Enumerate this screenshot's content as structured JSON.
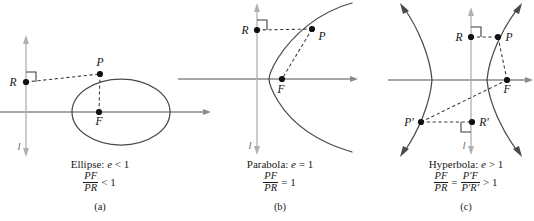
{
  "figure": {
    "panels": [
      {
        "id": "a",
        "curve_type": "ellipse",
        "caption_title_prefix": "Ellipse:",
        "caption_title_var": "e",
        "caption_title_relation": "< 1",
        "ratio_numerator": "PF",
        "ratio_denominator": "PR",
        "ratio_relation": "< 1",
        "panel_letter": "(a)",
        "axis_letter": "l",
        "points": [
          {
            "label": "R",
            "x": 26,
            "y": 82
          },
          {
            "label": "P",
            "x": 100,
            "y": 74
          },
          {
            "label": "F",
            "x": 99,
            "y": 112
          }
        ]
      },
      {
        "id": "b",
        "curve_type": "parabola",
        "caption_title_prefix": "Parabola:",
        "caption_title_var": "e",
        "caption_title_relation": "= 1",
        "ratio_numerator": "PF",
        "ratio_denominator": "PR",
        "ratio_relation": "= 1",
        "panel_letter": "(b)",
        "axis_letter": "l",
        "points": [
          {
            "label": "R",
            "x": 257,
            "y": 30
          },
          {
            "label": "P",
            "x": 312,
            "y": 29
          },
          {
            "label": "F",
            "x": 282,
            "y": 79
          }
        ]
      },
      {
        "id": "c",
        "curve_type": "hyperbola",
        "caption_title_prefix": "Hyperbola:",
        "caption_title_var": "e",
        "caption_title_relation": "> 1",
        "ratio_numerator": "PF",
        "ratio_denominator": "PR",
        "ratio_relation": "> 1",
        "ratio2_numerator": "P′F",
        "ratio2_denominator": "P′R′",
        "ratio_equals": "=",
        "panel_letter": "(c)",
        "axis_letter": "l",
        "points": [
          {
            "label": "R",
            "x": 472,
            "y": 37
          },
          {
            "label": "P",
            "x": 498,
            "y": 37
          },
          {
            "label": "F",
            "x": 507,
            "y": 80
          },
          {
            "label": "P′",
            "x": 421,
            "y": 122
          },
          {
            "label": "R′",
            "x": 472,
            "y": 122
          }
        ]
      }
    ],
    "colors": {
      "curve": "#4a4a4a",
      "axis": "#8a8a8a",
      "directrix": "#b0b0b0",
      "dashed": "#3a3a3a",
      "point": "#111111",
      "text": "#1a1a1a",
      "background": "#ffffff"
    }
  }
}
